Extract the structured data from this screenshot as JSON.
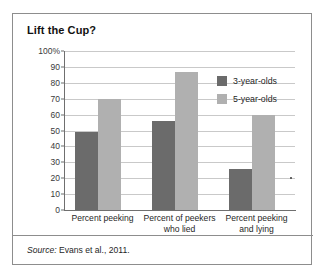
{
  "figure": {
    "title": "Lift the Cup?",
    "source_prefix": "Source:",
    "source_text": " Evans et al., 2011."
  },
  "chart_data": {
    "type": "bar",
    "title": "Lift the Cup?",
    "xlabel": "",
    "ylabel": "",
    "ylim": [
      0,
      100
    ],
    "yticks": [
      0,
      10,
      20,
      30,
      40,
      50,
      60,
      70,
      80,
      90,
      100
    ],
    "ytick_labels": [
      "0",
      "10",
      "20",
      "30",
      "40",
      "50",
      "60",
      "70",
      "80",
      "90",
      "100%"
    ],
    "grid": true,
    "legend_position": "upper right",
    "categories": [
      "Percent peeking",
      "Percent of peekers who lied",
      "Percent peeking and lying"
    ],
    "category_lines": [
      [
        "Percent peeking"
      ],
      [
        "Percent of peekers",
        "who lied"
      ],
      [
        "Percent peeking",
        "and lying"
      ]
    ],
    "series": [
      {
        "name": "3-year-olds",
        "color": "#6b6b6b",
        "values": [
          49,
          56,
          26
        ]
      },
      {
        "name": "5-year-olds",
        "color": "#b0b0b0",
        "values": [
          70,
          87,
          60
        ]
      }
    ]
  },
  "colors": {
    "series_3yo": "#6b6b6b",
    "series_5yo": "#b0b0b0",
    "gridline": "#c9c9c9",
    "axis": "#6f6f6f",
    "frame": "#8d8d8d"
  }
}
